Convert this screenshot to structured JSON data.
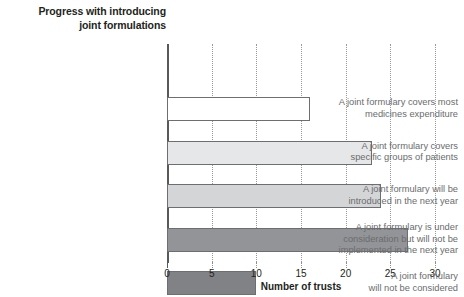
{
  "chart_data": {
    "type": "bar",
    "orientation": "horizontal",
    "title": "Progress with introducing joint formulations",
    "title_lines": [
      "Progress with introducing",
      "joint formulations"
    ],
    "xlabel": "Number of trusts",
    "ylabel": "",
    "xlim": [
      0,
      30
    ],
    "xticks": [
      0,
      5,
      10,
      15,
      20,
      25,
      30
    ],
    "xtick_labels": [
      "0",
      "5",
      "10",
      "15",
      "20",
      "25",
      "30"
    ],
    "grid": "vertical-dotted",
    "legend": "none",
    "categories": [
      "A joint formulary covers most medicines expenditure",
      "A joint formulary covers specific groups of patients",
      "A joint formulary will be introduced in the next year",
      "A joint formulary is under consideration but will not be implemented in the next year",
      "A joint formulary will not be considered"
    ],
    "category_lines": [
      [
        "A joint formulary covers most",
        "medicines expenditure"
      ],
      [
        "A joint formulary covers",
        "specific groups of patients"
      ],
      [
        "A joint formulary will be",
        "introduced in the next year"
      ],
      [
        "A joint formulary is under",
        "consideration but will not be",
        "implemented in the next year"
      ],
      [
        "A joint formulary",
        "will not be considered"
      ]
    ],
    "values": [
      16,
      23,
      24,
      27,
      10
    ],
    "bar_colors": [
      "#ffffff",
      "#e6e7e8",
      "#d4d5d6",
      "#929497",
      "#808285"
    ],
    "bar_edge_color": "#6d6e71",
    "axis_color": "#58595b",
    "label_color": "#6a6c6e",
    "title_color": "#231f20",
    "background": "#ffffff"
  }
}
